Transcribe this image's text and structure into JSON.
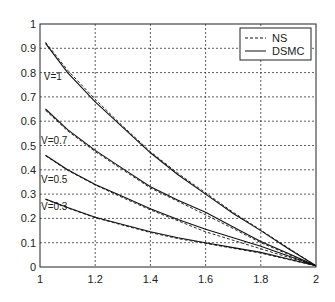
{
  "chart_data": {
    "type": "line",
    "title": "",
    "xlabel": "",
    "ylabel": "",
    "xlim": [
      1,
      2
    ],
    "ylim": [
      0,
      1
    ],
    "grid": true,
    "legend_position": "top-right",
    "x_ticks": [
      "1",
      "1.2",
      "1.4",
      "1.6",
      "1.8",
      "2"
    ],
    "y_ticks": [
      "0",
      "0.1",
      "0.2",
      "0.3",
      "0.4",
      "0.5",
      "0.6",
      "0.7",
      "0.8",
      "0.9",
      "1"
    ],
    "legend": [
      {
        "label": "NS",
        "style": "dashed"
      },
      {
        "label": "DSMC",
        "style": "solid"
      }
    ],
    "x": [
      1.02,
      1.1,
      1.2,
      1.3,
      1.4,
      1.5,
      1.6,
      1.7,
      1.8,
      1.9,
      2.0
    ],
    "series": [
      {
        "name": "V=1 DSMC",
        "group": "V=1",
        "method": "DSMC",
        "values": [
          0.92,
          0.8,
          0.68,
          0.575,
          0.47,
          0.38,
          0.3,
          0.22,
          0.15,
          0.075,
          0.005
        ]
      },
      {
        "name": "V=1 NS",
        "group": "V=1",
        "method": "NS",
        "values": [
          0.925,
          0.81,
          0.69,
          0.58,
          0.475,
          0.385,
          0.305,
          0.225,
          0.152,
          0.078,
          0.005
        ]
      },
      {
        "name": "V=0.7 DSMC",
        "group": "V=0.7",
        "method": "DSMC",
        "values": [
          0.65,
          0.565,
          0.48,
          0.405,
          0.33,
          0.275,
          0.225,
          0.165,
          0.105,
          0.055,
          0.005
        ]
      },
      {
        "name": "V=0.7 NS",
        "group": "V=0.7",
        "method": "NS",
        "values": [
          0.645,
          0.56,
          0.475,
          0.4,
          0.325,
          0.27,
          0.215,
          0.158,
          0.1,
          0.052,
          0.005
        ]
      },
      {
        "name": "V=0.5 DSMC",
        "group": "V=0.5",
        "method": "DSMC",
        "values": [
          0.46,
          0.4,
          0.34,
          0.29,
          0.24,
          0.195,
          0.155,
          0.12,
          0.085,
          0.045,
          0.005
        ]
      },
      {
        "name": "V=0.5 NS",
        "group": "V=0.5",
        "method": "NS",
        "values": [
          0.458,
          0.398,
          0.338,
          0.285,
          0.235,
          0.19,
          0.145,
          0.11,
          0.075,
          0.04,
          0.005
        ]
      },
      {
        "name": "V=0.3 DSMC",
        "group": "V=0.3",
        "method": "DSMC",
        "values": [
          0.28,
          0.245,
          0.205,
          0.175,
          0.145,
          0.12,
          0.1,
          0.08,
          0.06,
          0.033,
          0.005
        ]
      },
      {
        "name": "V=0.3 NS",
        "group": "V=0.3",
        "method": "NS",
        "values": [
          0.278,
          0.243,
          0.203,
          0.172,
          0.142,
          0.117,
          0.097,
          0.077,
          0.057,
          0.031,
          0.005
        ]
      }
    ],
    "annotations": [
      {
        "text": "V=1",
        "x": 1.01,
        "y": 0.78
      },
      {
        "text": "V=0.7",
        "x": 1.0,
        "y": 0.52
      },
      {
        "text": "V=0.5",
        "x": 1.0,
        "y": 0.36
      },
      {
        "text": "V=0.3",
        "x": 1.0,
        "y": 0.245
      }
    ]
  },
  "colors": {
    "axis": "#222222",
    "grid": "#333333",
    "line": "#111111",
    "background": "#ffffff"
  }
}
